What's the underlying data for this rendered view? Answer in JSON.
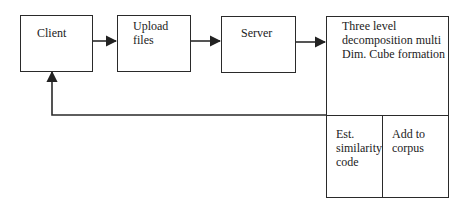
{
  "diagram": {
    "nodes": {
      "client": {
        "label": "Client"
      },
      "upload": {
        "label": "Upload\nfiles"
      },
      "server": {
        "label": "Server"
      },
      "decomposition": {
        "label": "Three level\ndecomposition multi\nDim. Cube formation"
      },
      "similarity": {
        "label": "Est.\nsimilarity\ncode"
      },
      "corpus": {
        "label": "Add to\ncorpus"
      }
    },
    "edges": [
      {
        "from": "client",
        "to": "upload"
      },
      {
        "from": "upload",
        "to": "server"
      },
      {
        "from": "server",
        "to": "decomposition"
      },
      {
        "from": "decomposition",
        "to": "client",
        "type": "feedback"
      }
    ]
  }
}
